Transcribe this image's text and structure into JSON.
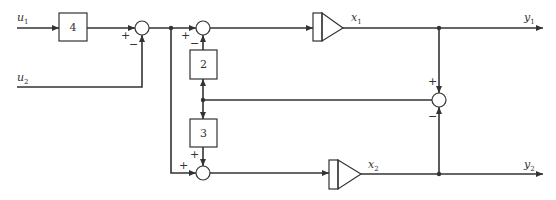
{
  "diagram": {
    "type": "block-diagram",
    "inputs": [
      {
        "id": "u1",
        "label": "u",
        "sub": "1"
      },
      {
        "id": "u2",
        "label": "u",
        "sub": "2"
      }
    ],
    "outputs": [
      {
        "id": "y1",
        "label": "y",
        "sub": "1"
      },
      {
        "id": "y2",
        "label": "y",
        "sub": "2"
      }
    ],
    "states": [
      {
        "id": "x1",
        "label": "x",
        "sub": "1"
      },
      {
        "id": "x2",
        "label": "x",
        "sub": "2"
      }
    ],
    "gain_blocks": [
      {
        "id": "g4",
        "value": "4"
      },
      {
        "id": "g2",
        "value": "2"
      },
      {
        "id": "g3",
        "value": "3"
      }
    ],
    "summing_junctions": [
      {
        "id": "s1",
        "signs": [
          "+",
          "−"
        ]
      },
      {
        "id": "s2",
        "signs": [
          "+",
          "−"
        ]
      },
      {
        "id": "s3",
        "signs": [
          "+",
          "+"
        ]
      },
      {
        "id": "s4",
        "signs": [
          "+",
          "−"
        ]
      }
    ],
    "integrators": [
      "amp1",
      "amp2"
    ],
    "colors": {
      "stroke": "#333333",
      "background": "#ffffff"
    }
  }
}
